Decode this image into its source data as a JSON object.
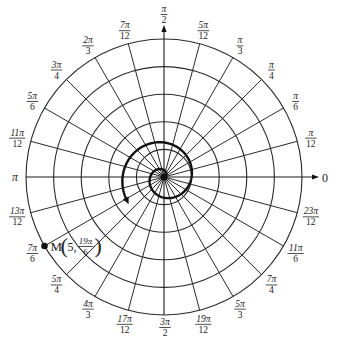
{
  "diagram": {
    "type": "polar-grid",
    "center": [
      164,
      177
    ],
    "ring_spacing_px": 27.6,
    "ring_count": 5,
    "ring_values": [
      1,
      2,
      3,
      4,
      5
    ],
    "spoke_step_deg": 15,
    "colors": {
      "ink": "#222222",
      "background": "#ffffff"
    }
  },
  "axes": {
    "polar_axis_label": "0",
    "left_label": "π",
    "top_label": {
      "num": "π",
      "den": "2"
    },
    "bottom_label": {
      "num": "3π",
      "den": "2"
    }
  },
  "angle_labels": [
    {
      "deg": 15,
      "num": "π",
      "den": "12"
    },
    {
      "deg": 30,
      "num": "π",
      "den": "6"
    },
    {
      "deg": 45,
      "num": "π",
      "den": "4"
    },
    {
      "deg": 60,
      "num": "π",
      "den": "3"
    },
    {
      "deg": 75,
      "num": "5π",
      "den": "12"
    },
    {
      "deg": 105,
      "num": "7π",
      "den": "12"
    },
    {
      "deg": 120,
      "num": "2π",
      "den": "3"
    },
    {
      "deg": 135,
      "num": "3π",
      "den": "4"
    },
    {
      "deg": 150,
      "num": "5π",
      "den": "6"
    },
    {
      "deg": 165,
      "num": "11π",
      "den": "12"
    },
    {
      "deg": 195,
      "num": "13π",
      "den": "12"
    },
    {
      "deg": 210,
      "num": "7π",
      "den": "6"
    },
    {
      "deg": 225,
      "num": "5π",
      "den": "4"
    },
    {
      "deg": 240,
      "num": "4π",
      "den": "3"
    },
    {
      "deg": 255,
      "num": "17π",
      "den": "12"
    },
    {
      "deg": 285,
      "num": "19π",
      "den": "12"
    },
    {
      "deg": 300,
      "num": "5π",
      "den": "3"
    },
    {
      "deg": 315,
      "num": "7π",
      "den": "4"
    },
    {
      "deg": 330,
      "num": "11π",
      "den": "6"
    },
    {
      "deg": 345,
      "num": "23π",
      "den": "12"
    }
  ],
  "spiral": {
    "equation": "r = θ/(2π)",
    "theta_start": 0,
    "theta_end_label": "19π/6",
    "arrow": true
  },
  "point": {
    "name": "M",
    "r": 5,
    "theta_deg": 210,
    "label_prefix": "M",
    "label_r": "5,",
    "label_theta_num": "19π",
    "label_theta_den": "6"
  }
}
